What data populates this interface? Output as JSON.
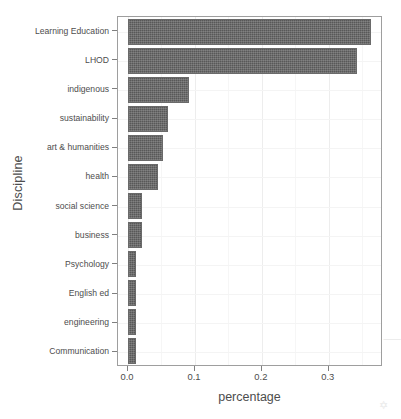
{
  "chart_data": {
    "type": "bar",
    "orientation": "horizontal",
    "title": "",
    "xlabel": "percentage",
    "ylabel": "Discipline",
    "xlim": [
      -0.015,
      0.381
    ],
    "xticks": [
      0.0,
      0.1,
      0.2,
      0.3
    ],
    "xtick_labels": [
      "0.0",
      "0.1",
      "0.2",
      "0.3"
    ],
    "x_minor_ticks": [
      0.05,
      0.15,
      0.25,
      0.35
    ],
    "grid": true,
    "legend": "none",
    "bar_color": "#585858",
    "panel_border_color": "#9e9e9e",
    "grid_color": "#ededed",
    "text_color": "#4d4d4d",
    "categories": [
      "Learning Education",
      "LHOD",
      "indigenous",
      "sustainability",
      "art & humanities",
      "health",
      "social science",
      "business",
      "Psychology",
      "English ed",
      "engineering",
      "Communication"
    ],
    "values": [
      0.363,
      0.342,
      0.091,
      0.06,
      0.052,
      0.045,
      0.021,
      0.021,
      0.012,
      0.012,
      0.012,
      0.012
    ]
  },
  "artifacts": [
    {
      "glyph": "⸺",
      "x": 383,
      "y": 330
    },
    {
      "glyph": "✡",
      "x": 379,
      "y": 399
    }
  ]
}
